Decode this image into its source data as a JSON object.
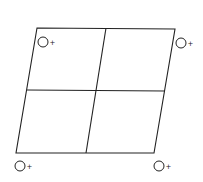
{
  "diagram": {
    "type": "parallelogram-grid",
    "stroke_color": "#222222",
    "background": "#ffffff",
    "outline": {
      "top_left": [
        37,
        28
      ],
      "top_right": [
        175,
        29
      ],
      "bottom_right": [
        154,
        153
      ],
      "bottom_left": [
        16,
        153
      ]
    },
    "dividers": {
      "vertical": {
        "top": [
          106,
          28
        ],
        "bottom": [
          86,
          153
        ]
      },
      "horizontal": {
        "left": [
          27,
          90
        ],
        "right": [
          165,
          91
        ]
      }
    },
    "markers": [
      {
        "position": "top-left",
        "cx": 43,
        "cy": 42,
        "r": 5,
        "sign": "+"
      },
      {
        "position": "top-right",
        "cx": 181,
        "cy": 43,
        "r": 5,
        "sign": "+"
      },
      {
        "position": "bottom-left",
        "cx": 20,
        "cy": 166,
        "r": 5,
        "sign": "+"
      },
      {
        "position": "bottom-right",
        "cx": 159,
        "cy": 166,
        "r": 5,
        "sign": "+"
      }
    ]
  }
}
